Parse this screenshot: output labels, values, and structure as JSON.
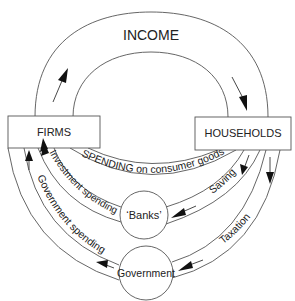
{
  "diagram": {
    "title_arc_label": "INCOME",
    "nodes": {
      "firms": "FIRMS",
      "households": "HOUSEHOLDS",
      "banks": "‘Banks’",
      "government": "Government"
    },
    "flows": {
      "income": "INCOME",
      "consumer_spending": "SPENDING on consumer goods",
      "saving": "Saving",
      "investment_spending": "Investment spending",
      "taxation": "Taxation",
      "government_spending": "Government spending"
    },
    "colors": {
      "stroke": "#555555",
      "text": "#222222",
      "arrow": "#111111",
      "background": "#ffffff"
    }
  }
}
